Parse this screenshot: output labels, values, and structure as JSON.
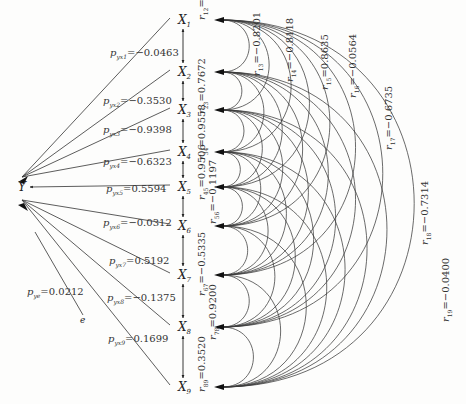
{
  "dependent": {
    "label": "Y"
  },
  "residual": {
    "label": "e",
    "coefficient_label": "p_ye",
    "coefficient": "0.0212"
  },
  "factors": [
    {
      "label": "X",
      "sub": "1"
    },
    {
      "label": "X",
      "sub": "2"
    },
    {
      "label": "X",
      "sub": "3"
    },
    {
      "label": "X",
      "sub": "4"
    },
    {
      "label": "X",
      "sub": "5"
    },
    {
      "label": "X",
      "sub": "6"
    },
    {
      "label": "X",
      "sub": "7"
    },
    {
      "label": "X",
      "sub": "8"
    },
    {
      "label": "X",
      "sub": "9"
    }
  ],
  "path_coefficients": [
    {
      "name": "p_yx1",
      "value": "−0.0463"
    },
    {
      "name": "p_yx2",
      "value": "−0.3530"
    },
    {
      "name": "p_yx3",
      "value": "−0.9398"
    },
    {
      "name": "p_yx4",
      "value": "−0.6323"
    },
    {
      "name": "p_yx5",
      "value": "0.5594"
    },
    {
      "name": "p_yx6",
      "value": "−0.0312"
    },
    {
      "name": "p_yx7",
      "value": "0.5192"
    },
    {
      "name": "p_yx8",
      "value": "−0.1375"
    },
    {
      "name": "p_yx9",
      "value": "0.1699"
    }
  ],
  "correlations": [
    {
      "name": "r12",
      "i": 1,
      "j": 2,
      "value": "0.6727"
    },
    {
      "name": "r13",
      "i": 1,
      "j": 3,
      "value": "−0.8201"
    },
    {
      "name": "r14",
      "i": 1,
      "j": 4,
      "value": "−0.8118"
    },
    {
      "name": "r15",
      "i": 1,
      "j": 5,
      "value": "0.8635"
    },
    {
      "name": "r16",
      "i": 1,
      "j": 6,
      "value": "−0.0564"
    },
    {
      "name": "r17",
      "i": 1,
      "j": 7,
      "value": "−0.6735"
    },
    {
      "name": "r18",
      "i": 1,
      "j": 8,
      "value": "−0.7314"
    },
    {
      "name": "r19",
      "i": 1,
      "j": 9,
      "value": "−0.0400"
    },
    {
      "name": "r23",
      "i": 2,
      "j": 3,
      "value": "0.7672"
    },
    {
      "name": "r34",
      "i": 3,
      "j": 4,
      "value": "0.9558"
    },
    {
      "name": "r45",
      "i": 4,
      "j": 5,
      "value": "0.9506"
    },
    {
      "name": "r56",
      "i": 5,
      "j": 6,
      "value": "−0.1197"
    },
    {
      "name": "r67",
      "i": 6,
      "j": 7,
      "value": "−0.5335"
    },
    {
      "name": "r78",
      "i": 7,
      "j": 8,
      "value": "0.9200"
    },
    {
      "name": "r89",
      "i": 8,
      "j": 9,
      "value": "0.3520"
    }
  ]
}
